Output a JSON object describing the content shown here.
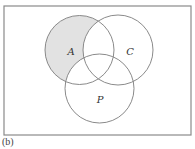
{
  "diagram": {
    "type": "venn",
    "caption": "(b)",
    "universe": {
      "x": 4,
      "y": 6,
      "width": 187,
      "height": 129,
      "stroke": "#8a8a8a"
    },
    "sets": [
      {
        "id": "A",
        "label": "A",
        "cx": 79.5,
        "cy": 50,
        "r": 34.5,
        "label_x": 71,
        "label_y": 55
      },
      {
        "id": "C",
        "label": "C",
        "cx": 118,
        "cy": 50,
        "r": 35,
        "label_x": 130,
        "label_y": 55
      },
      {
        "id": "P",
        "label": "P",
        "cx": 99.5,
        "cy": 88.5,
        "r": 34.5,
        "label_x": 100,
        "label_y": 103
      }
    ],
    "shaded_region": "A only (A minus C and P)",
    "colors": {
      "shade": "#e2e2e2",
      "circle_stroke": "#7d7d7d",
      "background": "#ffffff"
    }
  }
}
